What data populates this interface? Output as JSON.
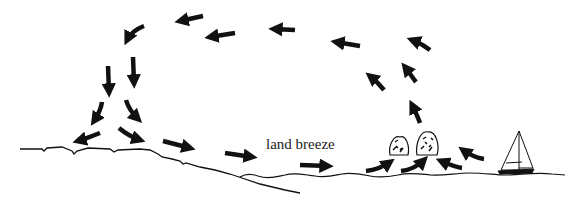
{
  "diagram": {
    "label": "land breeze",
    "colors": {
      "ink": "#111111",
      "background": "#ffffff"
    },
    "elements": {
      "land": "coastline / land surface (left)",
      "sea": "water surface (right)",
      "rocks": 2,
      "boat": "sailboat on water",
      "arrows": "circulation loop: air sinks over land, flows seaward along surface, rises over sea, returns landward aloft"
    }
  }
}
